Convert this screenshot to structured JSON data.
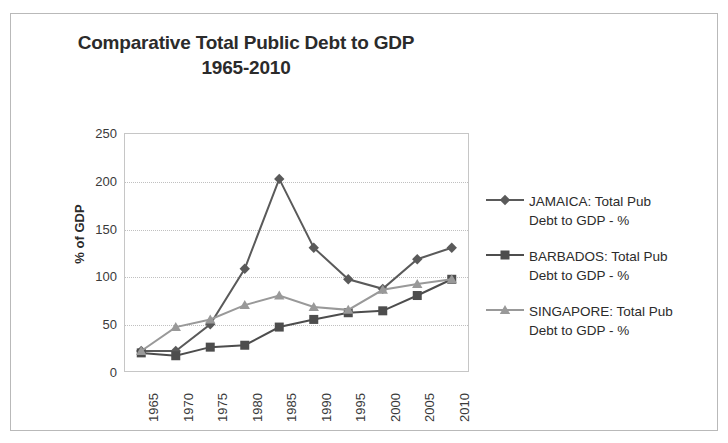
{
  "chart_data": {
    "type": "line",
    "title": "Comparative Total Public Debt to GDP",
    "subtitle": "1965-2010",
    "xlabel": "",
    "ylabel": "% of GDP",
    "categories": [
      "1965",
      "1970",
      "1975",
      "1980",
      "1985",
      "1990",
      "1995",
      "2000",
      "2005",
      "2010"
    ],
    "x": [
      1965,
      1970,
      1975,
      1980,
      1985,
      1990,
      1995,
      2000,
      2005,
      2010
    ],
    "ylim": [
      0,
      250
    ],
    "yticks": [
      0,
      50,
      100,
      150,
      200,
      250
    ],
    "grid": true,
    "legend_position": "right",
    "series": [
      {
        "name": "JAMAICA: Total Pub Debt to GDP - %",
        "label_line1": "JAMAICA: Total Pub",
        "label_line2": "Debt to GDP - %",
        "marker": "diamond",
        "color": "#5a5a5a",
        "values": [
          22,
          22,
          50,
          108,
          202,
          130,
          97,
          87,
          118,
          130
        ]
      },
      {
        "name": "BARBADOS: Total Pub Debt to GDP  - %",
        "label_line1": "BARBADOS: Total Pub",
        "label_line2": "Debt to GDP  - %",
        "marker": "square",
        "color": "#4d4d4d",
        "values": [
          20,
          17,
          26,
          28,
          47,
          55,
          62,
          64,
          80,
          97
        ]
      },
      {
        "name": "SINGAPORE: Total Pub Debt to GDP - %",
        "label_line1": "SINGAPORE: Total Pub",
        "label_line2": "Debt to GDP - %",
        "marker": "triangle",
        "color": "#999999",
        "values": [
          22,
          47,
          55,
          70,
          80,
          68,
          65,
          86,
          92,
          97
        ]
      }
    ]
  },
  "colors": {
    "frame_border": "#b9b9b9",
    "plot_border": "#c6c6c6",
    "gridline": "#c0c0c0",
    "text": "#2b2b2b",
    "tick_text": "#3a3a3a"
  }
}
